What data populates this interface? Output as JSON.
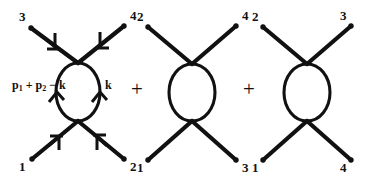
{
  "figure": {
    "background_color": "#ffffff",
    "ink_color": "#111111",
    "width": 365,
    "height": 183,
    "operators": [
      {
        "symbol": "+",
        "name": "plus-operator-1"
      },
      {
        "symbol": "+",
        "name": "plus-operator-2"
      }
    ],
    "diagrams": [
      {
        "id": "diagram-1",
        "channel_label": "",
        "external_labels": {
          "top_left": "3",
          "top_right": "4",
          "bottom_left": "1",
          "bottom_right": "2"
        },
        "momentum_labels": [
          {
            "id": "loop-left-momentum",
            "text": "p1 + p2 - k",
            "base": "p",
            "parts": [
              "p",
              "1",
              " + ",
              "p",
              "2",
              " − k"
            ]
          },
          {
            "id": "loop-right-momentum",
            "text": "k"
          }
        ],
        "has_leg_arrows": true,
        "has_loop_arrows": true
      },
      {
        "id": "diagram-2",
        "channel_label": "",
        "external_labels": {
          "top_left": "2",
          "top_right": "4",
          "bottom_left": "1",
          "bottom_right": "3"
        },
        "momentum_labels": [],
        "has_leg_arrows": false,
        "has_loop_arrows": false
      },
      {
        "id": "diagram-3",
        "channel_label": "",
        "external_labels": {
          "top_left": "2",
          "top_right": "3",
          "bottom_left": "1",
          "bottom_right": "4"
        },
        "momentum_labels": [],
        "has_leg_arrows": false,
        "has_loop_arrows": false
      }
    ]
  }
}
